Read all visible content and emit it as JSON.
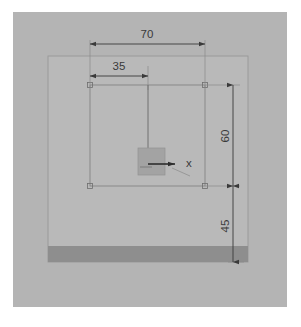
{
  "drawing": {
    "title": "CAD orthographic view with dimensions",
    "units": "mm",
    "background_color": "#ffffff",
    "panel_color": "#b4b4b4",
    "body_color": "#b9b9b9",
    "band_color": "#8e8e8e",
    "center_block_color": "#a3a3a3",
    "line_color": "#6e6e6e",
    "dimension_color": "#3a3a3a",
    "geometry": {
      "panel": {
        "x": 13,
        "y": 12,
        "width": 274,
        "height": 295
      },
      "body": {
        "x": 48,
        "y": 56,
        "width": 200,
        "height": 206
      },
      "bottom_band": {
        "x": 48,
        "y": 246,
        "width": 200,
        "height": 16
      },
      "inner_rect": {
        "x": 90,
        "y": 85,
        "width": 115,
        "height": 101
      },
      "center_block": {
        "x": 138,
        "y": 148,
        "width": 27,
        "height": 27
      },
      "origin": {
        "x": 148,
        "y": 164
      },
      "corner_markers": [
        {
          "x": 90,
          "y": 85
        },
        {
          "x": 205,
          "y": 85
        },
        {
          "x": 90,
          "y": 186
        },
        {
          "x": 205,
          "y": 186
        }
      ]
    },
    "dimensions": [
      {
        "id": "width-70",
        "label": "70",
        "orientation": "horizontal",
        "value": 70,
        "line_y": 44,
        "from_x": 90,
        "to_x": 205,
        "text_x": 147,
        "text_y": 38
      },
      {
        "id": "width-35",
        "label": "35",
        "orientation": "horizontal",
        "value": 35,
        "line_y": 76,
        "from_x": 90,
        "to_x": 148,
        "text_x": 119,
        "text_y": 70
      },
      {
        "id": "height-60",
        "label": "60",
        "orientation": "vertical",
        "value": 60,
        "line_x": 233,
        "from_y": 85,
        "to_y": 186,
        "text_x": 229,
        "text_y": 136
      },
      {
        "id": "height-45",
        "label": "45",
        "orientation": "vertical",
        "value": 45,
        "line_x": 233,
        "from_y": 186,
        "to_y": 262,
        "text_x": 229,
        "text_y": 226
      }
    ],
    "axes": {
      "x_axis": {
        "label": "x",
        "from_x": 148,
        "from_y": 164,
        "to_x": 182,
        "to_y": 164
      },
      "y_axis": {
        "label": "",
        "from_x": 148,
        "from_y": 85,
        "to_x": 148,
        "to_y": 164
      },
      "leader": {
        "from_x": 172,
        "from_y": 168,
        "to_x": 190,
        "to_y": 176
      }
    }
  }
}
